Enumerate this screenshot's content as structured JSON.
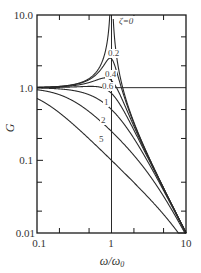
{
  "chart_data": {
    "type": "line",
    "title": "",
    "xlabel": "ω/ω₀",
    "ylabel": "G",
    "xscale": "log",
    "yscale": "log",
    "xlim": [
      0.1,
      10
    ],
    "ylim": [
      0.01,
      10.0
    ],
    "x_tick_labels": [
      "0.1",
      "1",
      "10"
    ],
    "y_tick_labels": [
      "10.0",
      "1.0",
      "0.1",
      "0.01"
    ],
    "grid": false,
    "legend": "inline curve labels",
    "reference_lines": [
      {
        "orientation": "vertical",
        "x": 1
      },
      {
        "orientation": "horizontal",
        "y": 1.0,
        "from_x": 1,
        "to_x": 10
      }
    ],
    "formula": "G = 1 / sqrt((1 - r^2)^2 + (2*zeta*r)^2), r = ω/ω₀",
    "series": [
      {
        "name": "ζ=0",
        "label": "ζ=0",
        "zeta": 0,
        "x": [
          0.1,
          0.5,
          0.9,
          0.97,
          1.03,
          1.1,
          2,
          10
        ],
        "values": [
          1.01,
          1.33,
          5.26,
          16.9,
          16.4,
          4.76,
          0.333,
          0.0101
        ]
      },
      {
        "name": "0.2",
        "label": "0.2",
        "zeta": 0.2,
        "x": [
          0.1,
          0.5,
          0.96,
          1,
          2,
          10
        ],
        "values": [
          1.01,
          1.28,
          2.55,
          2.5,
          0.316,
          0.0101
        ]
      },
      {
        "name": "0.4",
        "label": "0.4",
        "zeta": 0.4,
        "x": [
          0.1,
          0.5,
          0.82,
          1,
          2,
          10
        ],
        "values": [
          1.01,
          1.18,
          1.36,
          1.25,
          0.285,
          0.0101
        ]
      },
      {
        "name": "0.6",
        "label": "0.6",
        "zeta": 0.6,
        "x": [
          0.1,
          0.5,
          1,
          2,
          10
        ],
        "values": [
          1.0,
          1.04,
          0.833,
          0.248,
          0.01
        ]
      },
      {
        "name": "1",
        "label": "1",
        "zeta": 1,
        "x": [
          0.1,
          0.5,
          1,
          2,
          10
        ],
        "values": [
          0.99,
          0.8,
          0.5,
          0.2,
          0.0099
        ]
      },
      {
        "name": "2",
        "label": "2",
        "zeta": 2,
        "x": [
          0.1,
          0.5,
          1,
          2,
          10
        ],
        "values": [
          0.93,
          0.46,
          0.25,
          0.118,
          0.0096
        ]
      },
      {
        "name": "5",
        "label": "5",
        "zeta": 5,
        "x": [
          0.1,
          0.5,
          1,
          2,
          10
        ],
        "values": [
          0.71,
          0.2,
          0.1,
          0.05,
          0.0087
        ]
      }
    ]
  },
  "labels": {
    "y_axis": "G",
    "x_axis_main": "ω/ω",
    "x_axis_sub": "0",
    "zeta_prefix": "ζ=0",
    "y_ticks": {
      "t10": "10.0",
      "t1": "1.0",
      "t01": "0.1",
      "t001": "0.01"
    },
    "x_ticks": {
      "t01": "0.1",
      "t1": "1",
      "t10": "10"
    },
    "curve_labels": {
      "z02": "0.2",
      "z04": "0.4",
      "z06": "0.6",
      "z1": "1",
      "z2": "2",
      "z5": "5"
    }
  },
  "colors": {
    "line": "#2a2a2a",
    "axis": "#1a1a1a",
    "background": "#ffffff"
  }
}
